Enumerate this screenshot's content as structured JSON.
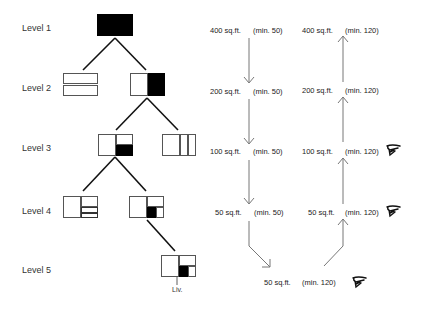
{
  "levels": [
    "Level 1",
    "Level 2",
    "Level 3",
    "Level 4",
    "Level 5"
  ],
  "left_column": [
    {
      "area": "400 sq.ft.",
      "min": "(min. 50)"
    },
    {
      "area": "200 sq.ft.",
      "min": "(min. 50)"
    },
    {
      "area": "100 sq.ft.",
      "min": "(min. 50)"
    },
    {
      "area": "50 sq.ft.",
      "min": "(min. 50)"
    }
  ],
  "right_column": [
    {
      "area": "400 sq.ft.",
      "min": "(min. 120)",
      "flag": false
    },
    {
      "area": "200 sq.ft.",
      "min": "(min. 120)",
      "flag": false
    },
    {
      "area": "100 sq.ft.",
      "min": "(min. 120)",
      "flag": true
    },
    {
      "area": "50 sq.ft.",
      "min": "(min. 120)",
      "flag": true
    }
  ],
  "bottom": {
    "area": "50 sq.ft.",
    "min": "(min. 120)",
    "flag": true
  },
  "liv_label": "Liv.",
  "icons": {
    "flag": "pointing-hand-icon"
  },
  "colors": {
    "line": "#111111",
    "arrow": "#777777",
    "fill": "#000000"
  }
}
